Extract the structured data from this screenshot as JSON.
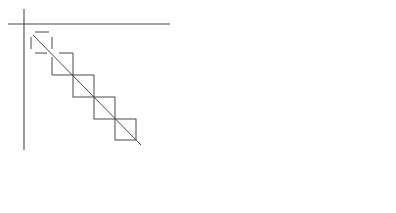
{
  "figures": [
    {
      "id": "fig-6-44",
      "caption": "Fig. 6.44",
      "column_headers": [
        "e",
        "w",
        "w2",
        "p",
        "q",
        "r"
      ],
      "row_headers": [
        "e",
        "w",
        "w2",
        "p",
        "q",
        "r"
      ],
      "cell_labels": {
        "e_e": "e",
        "e_w": "w",
        "w_e": "w",
        "w_w": "w2"
      },
      "legend_square": {
        "tl": "a",
        "tr": "b",
        "bl": "c",
        "br": "d"
      }
    },
    {
      "id": "fig-6-45",
      "caption": "Fig 6.45",
      "column_headers": [
        "e",
        "w",
        "w2",
        "p",
        "q",
        "r"
      ],
      "row_headers": [
        "e",
        "w",
        "w2",
        "p",
        "q",
        "r"
      ],
      "legend_square": {
        "tl": "a",
        "tr": "b",
        "bl": "c",
        "br": "d"
      }
    }
  ],
  "labels": {
    "e": "e",
    "w": "w",
    "w_base": "w",
    "sup2": "2",
    "p": "p",
    "q": "q",
    "r": "r",
    "a": "a",
    "b": "b",
    "c": "c",
    "d": "d"
  }
}
